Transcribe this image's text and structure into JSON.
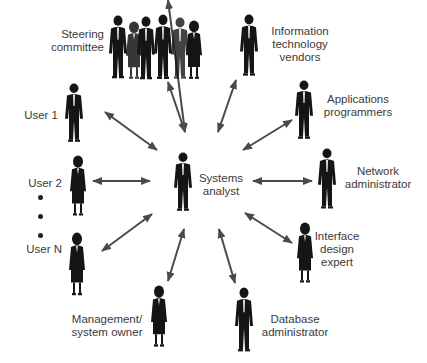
{
  "diagram": {
    "center": {
      "id": "systems-analyst",
      "lines": [
        "Systems",
        "analyst"
      ]
    },
    "nodes": [
      {
        "id": "steering-committee",
        "lines": [
          "Steering",
          "committee"
        ]
      },
      {
        "id": "it-vendors",
        "lines": [
          "Information",
          "technology",
          "vendors"
        ]
      },
      {
        "id": "applications-programmers",
        "lines": [
          "Applications",
          "programmers"
        ]
      },
      {
        "id": "network-administrator",
        "lines": [
          "Network",
          "administrator"
        ]
      },
      {
        "id": "interface-design-expert",
        "lines": [
          "Interface",
          "design",
          "expert"
        ]
      },
      {
        "id": "database-administrator",
        "lines": [
          "Database",
          "administrator"
        ]
      },
      {
        "id": "management-system-owner",
        "lines": [
          "Management/",
          "system owner"
        ]
      },
      {
        "id": "user-n",
        "lines": [
          "User N"
        ]
      },
      {
        "id": "user-2",
        "lines": [
          "User 2"
        ]
      },
      {
        "id": "user-1",
        "lines": [
          "User 1"
        ]
      }
    ],
    "ellipsis_between": [
      "User 2",
      "User N"
    ],
    "edges": [
      {
        "from": "systems-analyst",
        "to": "steering-committee",
        "type": "bidirectional"
      },
      {
        "from": "systems-analyst",
        "to": "it-vendors",
        "type": "bidirectional"
      },
      {
        "from": "systems-analyst",
        "to": "applications-programmers",
        "type": "bidirectional"
      },
      {
        "from": "systems-analyst",
        "to": "network-administrator",
        "type": "bidirectional"
      },
      {
        "from": "systems-analyst",
        "to": "interface-design-expert",
        "type": "bidirectional"
      },
      {
        "from": "systems-analyst",
        "to": "database-administrator",
        "type": "bidirectional"
      },
      {
        "from": "systems-analyst",
        "to": "management-system-owner",
        "type": "bidirectional"
      },
      {
        "from": "systems-analyst",
        "to": "user-n",
        "type": "bidirectional"
      },
      {
        "from": "systems-analyst",
        "to": "user-2",
        "type": "bidirectional"
      },
      {
        "from": "systems-analyst",
        "to": "user-1",
        "type": "bidirectional"
      }
    ],
    "colors": {
      "arrow": "#4a4a4a",
      "figure": "#1a1a1a",
      "text": "#3a3a3a"
    }
  }
}
